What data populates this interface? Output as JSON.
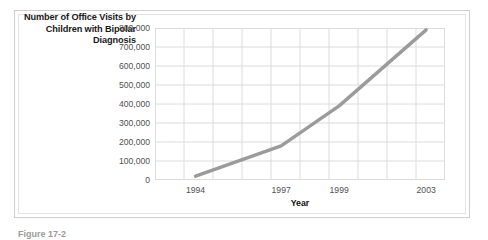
{
  "figure": {
    "caption": "Figure 17-2"
  },
  "chart_data": {
    "type": "line",
    "title": "Number of Office Visits by Children with Bipolar Diagnosis",
    "xlabel": "Year",
    "ylabel": "",
    "x_tick_labels": [
      "1994",
      "1997",
      "1999",
      "2003"
    ],
    "y_tick_labels": [
      "800,000",
      "700,000",
      "600,000",
      "500,000",
      "400,000",
      "300,000",
      "200,000",
      "100,000",
      "0"
    ],
    "ylim": [
      0,
      800000
    ],
    "y_tick_step": 100000,
    "grid": true,
    "grid_columns": 10,
    "legend": "none",
    "series": [
      {
        "name": "Office visits",
        "points": [
          {
            "x": "1994",
            "y": 20000
          },
          {
            "x": "1997",
            "y": 180000
          },
          {
            "x": "1999",
            "y": 390000
          },
          {
            "x": "2003",
            "y": 790000
          }
        ]
      }
    ],
    "colors": {
      "line": "#9b9b9b",
      "grid": "#dcdcdc",
      "plot_background": "#ffffff",
      "tick_text": "#4f4f4f",
      "title_text": "#1a1a1a"
    }
  }
}
